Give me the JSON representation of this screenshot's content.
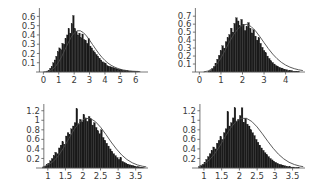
{
  "figure": {
    "title": "",
    "background": "#ffffff",
    "ink": "#1a1a1a",
    "curve_color": "#4a4a4a",
    "axis_color": "#555555",
    "label_color": "#3a3a3a",
    "layout": "2x2 grid of histograms with fitted density curves"
  },
  "chart_data": [
    {
      "id": "top-left",
      "type": "bar",
      "title": "",
      "xlabel": "",
      "ylabel": "",
      "grid": false,
      "legend": null,
      "xlim": [
        -0.35,
        6.8
      ],
      "ylim": [
        0,
        0.68
      ],
      "xticks": [
        0,
        1,
        2,
        3,
        4,
        5,
        6
      ],
      "xticklabels": [
        "0",
        "1",
        "2",
        "3",
        "4",
        "5",
        "6"
      ],
      "yticks": [
        0.1,
        0.2,
        0.3,
        0.4,
        0.5,
        0.6
      ],
      "yticklabels": [
        "0.1",
        "0.2",
        "0.3",
        "0.4",
        "0.5",
        "0.6"
      ],
      "bin_width": 0.1,
      "bin_starts": [
        0.2,
        0.3,
        0.4,
        0.5,
        0.6,
        0.7,
        0.8,
        0.9,
        1.0,
        1.1,
        1.2,
        1.3,
        1.4,
        1.5,
        1.6,
        1.7,
        1.8,
        1.9,
        2.0,
        2.1,
        2.2,
        2.3,
        2.4,
        2.5,
        2.6,
        2.7,
        2.8,
        2.9,
        3.0,
        3.1,
        3.2,
        3.3,
        3.4,
        3.5,
        3.6,
        3.7,
        3.8,
        3.9,
        4.0,
        4.1,
        4.2,
        4.3,
        4.4,
        4.5,
        4.6,
        4.7,
        4.8,
        4.9,
        5.0,
        5.1,
        5.2,
        5.3,
        5.4,
        5.5,
        5.6,
        5.7,
        5.8,
        5.9,
        6.0,
        6.1,
        6.2,
        6.3
      ],
      "values": [
        0.01,
        0.02,
        0.04,
        0.06,
        0.1,
        0.13,
        0.17,
        0.22,
        0.26,
        0.24,
        0.31,
        0.3,
        0.36,
        0.4,
        0.47,
        0.42,
        0.52,
        0.61,
        0.47,
        0.44,
        0.4,
        0.42,
        0.37,
        0.41,
        0.35,
        0.34,
        0.31,
        0.36,
        0.28,
        0.26,
        0.23,
        0.21,
        0.19,
        0.17,
        0.15,
        0.13,
        0.11,
        0.1,
        0.09,
        0.07,
        0.06,
        0.06,
        0.05,
        0.05,
        0.04,
        0.04,
        0.03,
        0.03,
        0.03,
        0.02,
        0.02,
        0.02,
        0.02,
        0.01,
        0.01,
        0.01,
        0.01,
        0.01,
        0.01,
        0.01,
        0.0,
        0.0
      ],
      "curve": {
        "name": "fitted density",
        "shape": "lognormal-like",
        "peak_x": 2.25,
        "peak_y": 0.45,
        "x": [
          0.0,
          0.2,
          0.4,
          0.6,
          0.8,
          1.0,
          1.2,
          1.4,
          1.6,
          1.8,
          2.0,
          2.2,
          2.4,
          2.6,
          2.8,
          3.0,
          3.2,
          3.4,
          3.6,
          3.8,
          4.0,
          4.2,
          4.4,
          4.6,
          4.8,
          5.0,
          5.2,
          5.4,
          5.6,
          5.8,
          6.0,
          6.3
        ],
        "y": [
          0.001,
          0.004,
          0.012,
          0.03,
          0.062,
          0.11,
          0.17,
          0.24,
          0.31,
          0.375,
          0.42,
          0.445,
          0.445,
          0.425,
          0.39,
          0.345,
          0.295,
          0.247,
          0.2,
          0.16,
          0.125,
          0.096,
          0.073,
          0.055,
          0.041,
          0.03,
          0.022,
          0.016,
          0.012,
          0.008,
          0.006,
          0.004
        ]
      }
    },
    {
      "id": "top-right",
      "type": "bar",
      "title": "",
      "xlabel": "",
      "ylabel": "",
      "grid": false,
      "legend": null,
      "xlim": [
        -0.25,
        4.9
      ],
      "ylim": [
        0,
        0.79
      ],
      "xticks": [
        0,
        1,
        2,
        3,
        4
      ],
      "xticklabels": [
        "0",
        "1",
        "2",
        "3",
        "4"
      ],
      "yticks": [
        0.1,
        0.2,
        0.3,
        0.4,
        0.5,
        0.6,
        0.7
      ],
      "yticklabels": [
        "0.1",
        "0.2",
        "0.3",
        "0.4",
        "0.5",
        "0.6",
        "0.7"
      ],
      "bin_width": 0.08,
      "bin_starts": [
        0.4,
        0.48,
        0.56,
        0.64,
        0.72,
        0.8,
        0.88,
        0.96,
        1.04,
        1.12,
        1.2,
        1.28,
        1.36,
        1.44,
        1.52,
        1.6,
        1.68,
        1.76,
        1.84,
        1.92,
        2.0,
        2.08,
        2.16,
        2.24,
        2.32,
        2.4,
        2.48,
        2.56,
        2.64,
        2.72,
        2.8,
        2.88,
        2.96,
        3.04,
        3.12,
        3.2,
        3.28,
        3.36,
        3.44,
        3.52,
        3.6,
        3.68,
        3.76,
        3.84,
        3.92,
        4.0,
        4.08,
        4.16,
        4.24,
        4.32,
        4.4,
        4.48,
        4.56,
        4.64
      ],
      "values": [
        0.01,
        0.02,
        0.04,
        0.07,
        0.11,
        0.16,
        0.21,
        0.27,
        0.33,
        0.3,
        0.38,
        0.43,
        0.47,
        0.55,
        0.5,
        0.61,
        0.68,
        0.64,
        0.58,
        0.66,
        0.6,
        0.52,
        0.57,
        0.62,
        0.55,
        0.49,
        0.53,
        0.45,
        0.4,
        0.43,
        0.36,
        0.31,
        0.27,
        0.24,
        0.2,
        0.17,
        0.14,
        0.12,
        0.1,
        0.08,
        0.07,
        0.06,
        0.05,
        0.04,
        0.03,
        0.03,
        0.02,
        0.02,
        0.02,
        0.01,
        0.01,
        0.01,
        0.01,
        0.0
      ],
      "curve": {
        "name": "fitted density",
        "shape": "lognormal-like",
        "peak_x": 2.15,
        "peak_y": 0.6,
        "x": [
          0.2,
          0.4,
          0.6,
          0.8,
          1.0,
          1.2,
          1.4,
          1.6,
          1.8,
          2.0,
          2.2,
          2.4,
          2.6,
          2.8,
          3.0,
          3.2,
          3.4,
          3.6,
          3.8,
          4.0,
          4.2,
          4.4,
          4.6,
          4.8
        ],
        "y": [
          0.002,
          0.012,
          0.04,
          0.095,
          0.175,
          0.275,
          0.38,
          0.472,
          0.545,
          0.588,
          0.597,
          0.57,
          0.516,
          0.445,
          0.368,
          0.293,
          0.225,
          0.168,
          0.122,
          0.087,
          0.061,
          0.042,
          0.028,
          0.018
        ]
      }
    },
    {
      "id": "bottom-left",
      "type": "bar",
      "title": "",
      "xlabel": "",
      "ylabel": "",
      "grid": false,
      "legend": null,
      "xlim": [
        0.72,
        3.85
      ],
      "ylim": [
        0,
        1.32
      ],
      "xticks": [
        1,
        1.5,
        2,
        2.5,
        3,
        3.5
      ],
      "xticklabels": [
        "1",
        "1.5",
        "2",
        "2.5",
        "3",
        "3.5"
      ],
      "yticks": [
        0.2,
        0.4,
        0.6,
        0.8,
        1,
        1.2
      ],
      "yticklabels": [
        "0.2",
        "0.4",
        "0.6",
        "0.8",
        "1",
        "1.2"
      ],
      "bin_width": 0.05,
      "bin_starts": [
        0.85,
        0.9,
        0.95,
        1.0,
        1.05,
        1.1,
        1.15,
        1.2,
        1.25,
        1.3,
        1.35,
        1.4,
        1.45,
        1.5,
        1.55,
        1.6,
        1.65,
        1.7,
        1.75,
        1.8,
        1.85,
        1.9,
        1.95,
        2.0,
        2.05,
        2.1,
        2.15,
        2.2,
        2.25,
        2.3,
        2.35,
        2.4,
        2.45,
        2.5,
        2.55,
        2.6,
        2.65,
        2.7,
        2.75,
        2.8,
        2.85,
        2.9,
        2.95,
        3.0,
        3.05,
        3.1,
        3.15,
        3.2,
        3.25,
        3.3,
        3.35,
        3.4,
        3.45,
        3.5,
        3.55,
        3.6,
        3.65,
        3.7
      ],
      "values": [
        0.02,
        0.04,
        0.07,
        0.1,
        0.15,
        0.2,
        0.26,
        0.33,
        0.3,
        0.42,
        0.48,
        0.55,
        0.5,
        0.67,
        0.74,
        0.7,
        0.82,
        0.88,
        0.95,
        1.24,
        0.92,
        1.02,
        0.97,
        1.12,
        1.05,
        0.98,
        1.08,
        1.03,
        0.9,
        0.95,
        0.85,
        0.78,
        0.72,
        0.8,
        0.64,
        0.58,
        0.52,
        0.46,
        0.4,
        0.35,
        0.3,
        0.26,
        0.22,
        0.18,
        0.22,
        0.14,
        0.12,
        0.1,
        0.08,
        0.07,
        0.06,
        0.05,
        0.04,
        0.03,
        0.03,
        0.02,
        0.02,
        0.01
      ],
      "curve": {
        "name": "fitted density",
        "shape": "normal-like",
        "peak_x": 2.08,
        "peak_y": 1.05,
        "x": [
          0.85,
          1.0,
          1.15,
          1.3,
          1.45,
          1.6,
          1.75,
          1.9,
          2.05,
          2.2,
          2.35,
          2.5,
          2.65,
          2.8,
          2.95,
          3.1,
          3.25,
          3.4,
          3.55,
          3.7,
          3.8
        ],
        "y": [
          0.02,
          0.06,
          0.135,
          0.255,
          0.425,
          0.62,
          0.81,
          0.955,
          1.035,
          1.04,
          0.975,
          0.855,
          0.705,
          0.545,
          0.4,
          0.275,
          0.178,
          0.11,
          0.064,
          0.036,
          0.024
        ]
      }
    },
    {
      "id": "bottom-right",
      "type": "bar",
      "title": "",
      "xlabel": "",
      "ylabel": "",
      "grid": false,
      "legend": null,
      "xlim": [
        0.72,
        3.85
      ],
      "ylim": [
        0,
        1.32
      ],
      "xticks": [
        1,
        1.5,
        2,
        2.5,
        3,
        3.5
      ],
      "xticklabels": [
        "1",
        "1.5",
        "2",
        "2.5",
        "3",
        "3.5"
      ],
      "yticks": [
        0.2,
        0.4,
        0.6,
        0.8,
        1,
        1.2
      ],
      "yticklabels": [
        "0.2",
        "0.4",
        "0.6",
        "0.8",
        "1",
        "1.2"
      ],
      "bin_width": 0.05,
      "bin_starts": [
        0.85,
        0.9,
        0.95,
        1.0,
        1.05,
        1.1,
        1.15,
        1.2,
        1.25,
        1.3,
        1.35,
        1.4,
        1.45,
        1.5,
        1.55,
        1.6,
        1.65,
        1.7,
        1.75,
        1.8,
        1.85,
        1.9,
        1.95,
        2.0,
        2.05,
        2.1,
        2.15,
        2.2,
        2.25,
        2.3,
        2.35,
        2.4,
        2.45,
        2.5,
        2.55,
        2.6,
        2.65,
        2.7,
        2.75,
        2.8,
        2.85,
        2.9,
        2.95,
        3.0,
        3.05,
        3.1,
        3.15,
        3.2,
        3.25,
        3.3,
        3.35,
        3.4,
        3.45,
        3.5,
        3.55,
        3.6,
        3.65,
        3.7
      ],
      "values": [
        0.03,
        0.05,
        0.08,
        0.12,
        0.18,
        0.24,
        0.3,
        0.37,
        0.44,
        0.4,
        0.52,
        0.58,
        0.66,
        0.6,
        0.74,
        0.82,
        1.18,
        0.88,
        0.95,
        1.05,
        1.26,
        0.98,
        1.02,
        1.1,
        1.26,
        0.96,
        1.04,
        0.92,
        0.88,
        0.8,
        0.74,
        0.68,
        0.6,
        0.54,
        0.48,
        0.42,
        0.37,
        0.32,
        0.28,
        0.24,
        0.2,
        0.17,
        0.14,
        0.12,
        0.1,
        0.08,
        0.07,
        0.06,
        0.05,
        0.04,
        0.03,
        0.03,
        0.02,
        0.02,
        0.01,
        0.01,
        0.01,
        0.0
      ],
      "curve": {
        "name": "fitted density",
        "shape": "normal-like",
        "peak_x": 2.05,
        "peak_y": 1.06,
        "x": [
          0.85,
          1.0,
          1.15,
          1.3,
          1.45,
          1.6,
          1.75,
          1.9,
          2.05,
          2.2,
          2.35,
          2.5,
          2.65,
          2.8,
          2.95,
          3.1,
          3.25,
          3.4,
          3.55,
          3.7,
          3.8
        ],
        "y": [
          0.03,
          0.08,
          0.165,
          0.295,
          0.465,
          0.655,
          0.835,
          0.97,
          1.04,
          1.04,
          0.975,
          0.86,
          0.715,
          0.56,
          0.415,
          0.29,
          0.192,
          0.12,
          0.072,
          0.041,
          0.028
        ]
      }
    }
  ]
}
